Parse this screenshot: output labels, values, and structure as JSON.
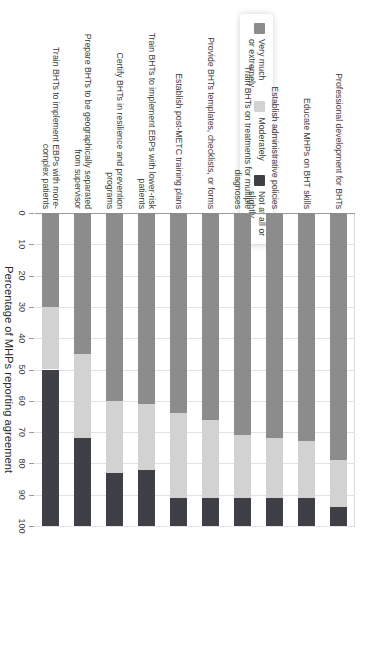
{
  "chart_data": {
    "type": "bar",
    "orientation": "horizontal-stacked",
    "title": "",
    "xlabel": "Percentage of MHPs reporting agreement\nwith potential changes",
    "ylabel": "",
    "xlim": [
      0,
      100
    ],
    "xticks": [
      0,
      10,
      20,
      30,
      40,
      50,
      60,
      70,
      80,
      90,
      100
    ],
    "grid": true,
    "legend_position": "top-left",
    "categories": [
      "Professional development for BHTs",
      "Educate MHPs on BHT skills",
      "Establish administrative policies",
      "Train BHTs on treatments for multiple\ndiagnoses",
      "Provide BHTs templates, checklists, or forms",
      "Establish post-METC training plans",
      "Train BHTs to implement EBPs with lower-risk\npatients",
      "Certify BHTs in resilience and prevention\nprograms",
      "Prepare BHTs to be geographically separated\nfrom supervisor",
      "Train BHTs to implement EBPs with more-\ncomplex patients"
    ],
    "series": [
      {
        "name": "Very much\nor extremely",
        "color": "#8c8c8c",
        "values": [
          79,
          73,
          72,
          71,
          66,
          64,
          61,
          60,
          45,
          30
        ]
      },
      {
        "name": "Moderately",
        "color": "#d2d2d2",
        "values": [
          15,
          18,
          19,
          20,
          25,
          27,
          21,
          23,
          27,
          20
        ]
      },
      {
        "name": "Not at all or\nslightly",
        "color": "#3f4046",
        "values": [
          6,
          9,
          9,
          9,
          9,
          9,
          18,
          17,
          28,
          50
        ]
      }
    ]
  },
  "legend": {
    "items": [
      {
        "label": "Very much\nor extremely",
        "color": "#8c8c8c"
      },
      {
        "label": "Moderately",
        "color": "#d2d2d2"
      },
      {
        "label": "Not at all or\nslightly",
        "color": "#3f4046"
      }
    ]
  },
  "axis": {
    "title": "Percentage of MHPs reporting agreement\nwith potential changes",
    "tick_labels": [
      "0",
      "10",
      "20",
      "30",
      "40",
      "50",
      "60",
      "70",
      "80",
      "90",
      "100"
    ]
  }
}
